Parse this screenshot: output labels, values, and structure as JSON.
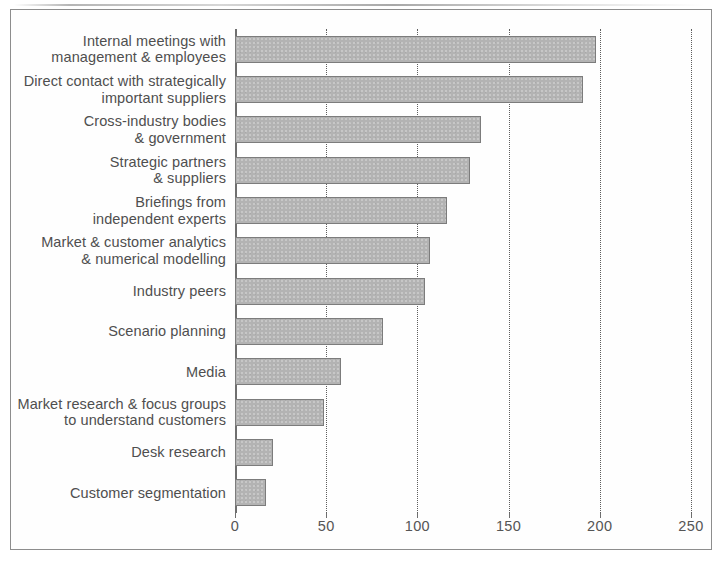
{
  "chart_data": {
    "type": "bar",
    "orientation": "horizontal",
    "title": "",
    "xlabel": "",
    "ylabel": "",
    "xlim": [
      0,
      260
    ],
    "xticks": [
      0,
      50,
      100,
      150,
      200,
      250
    ],
    "xtick_labels": [
      "0",
      "50",
      "100",
      "150",
      "200",
      "250"
    ],
    "grid": "vertical dotted gridlines at each x tick",
    "legend": "none",
    "bar_color": "#b3b3b3",
    "bar_edge_color": "#7c7c7c",
    "categories": [
      "Internal meetings with\nmanagement & employees",
      "Direct contact with strategically\nimportant suppliers",
      "Cross-industry bodies\n& government",
      "Strategic partners\n& suppliers",
      "Briefings from\nindependent experts",
      "Market & customer analytics\n& numerical modelling",
      "Industry peers",
      "Scenario planning",
      "Media",
      "Market research & focus groups\nto understand customers",
      "Desk research",
      "Customer segmentation"
    ],
    "values": [
      198,
      191,
      135,
      129,
      116,
      107,
      104,
      81,
      58,
      49,
      21,
      17
    ]
  },
  "axis": {
    "tick_0": "0",
    "tick_50": "50",
    "tick_100": "100",
    "tick_150": "150",
    "tick_200": "200",
    "tick_250": "250"
  }
}
